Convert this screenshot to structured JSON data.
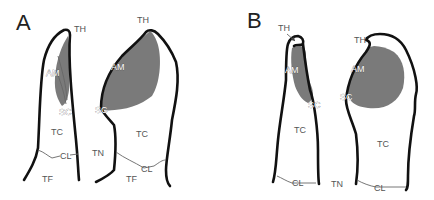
{
  "figure": {
    "panels": [
      {
        "id": "A",
        "label": "A",
        "teeth": [
          {
            "view": "left",
            "labels": {
              "TH": "TH",
              "AM": "AM",
              "SC": "SC",
              "TC": "TC",
              "CL": "CL",
              "TF": "TF"
            }
          },
          {
            "view": "right",
            "labels": {
              "TH": "TH",
              "AM": "AM",
              "SC": "SC",
              "TC": "TC",
              "CL": "CL",
              "TF": "TF"
            }
          }
        ],
        "between_label": "TN"
      },
      {
        "id": "B",
        "label": "B",
        "teeth": [
          {
            "view": "left",
            "labels": {
              "TH": "TH",
              "AM": "AM",
              "SC": "SC",
              "TC": "TC",
              "CL": "CL"
            }
          },
          {
            "view": "right",
            "labels": {
              "TH": "TH",
              "AM": "AM",
              "SC": "SC",
              "TC": "TC",
              "CL": "CL"
            }
          }
        ],
        "between_label": "TN"
      }
    ],
    "colors": {
      "outline": "#111111",
      "shaded_region": "#7a7a7a",
      "label_text": "#555555"
    }
  }
}
